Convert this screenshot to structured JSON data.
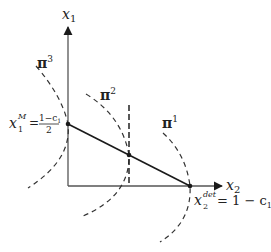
{
  "diagram": {
    "type": "economic-diagram",
    "axes": {
      "y_label": "x",
      "y_label_sub": "1",
      "x_label": "x",
      "x_label_sub": "2"
    },
    "isoprofit_curves": [
      {
        "name": "π",
        "sup": "3"
      },
      {
        "name": "π",
        "sup": "2"
      },
      {
        "name": "π",
        "sup": "1"
      }
    ],
    "annotations": {
      "monopoly_point": {
        "var": "x",
        "sup": "M",
        "sub": "1",
        "eq": "=",
        "numerator": "1−c",
        "numerator_sub": "1",
        "denominator": "2"
      },
      "deterrence_point": {
        "var": "x",
        "sup": "det",
        "sub": "2",
        "eq": "= 1 − c",
        "eq_sub": "1"
      }
    },
    "colors": {
      "line": "#1a1a1a",
      "axis": "#555555",
      "dashed": "#333333"
    }
  }
}
